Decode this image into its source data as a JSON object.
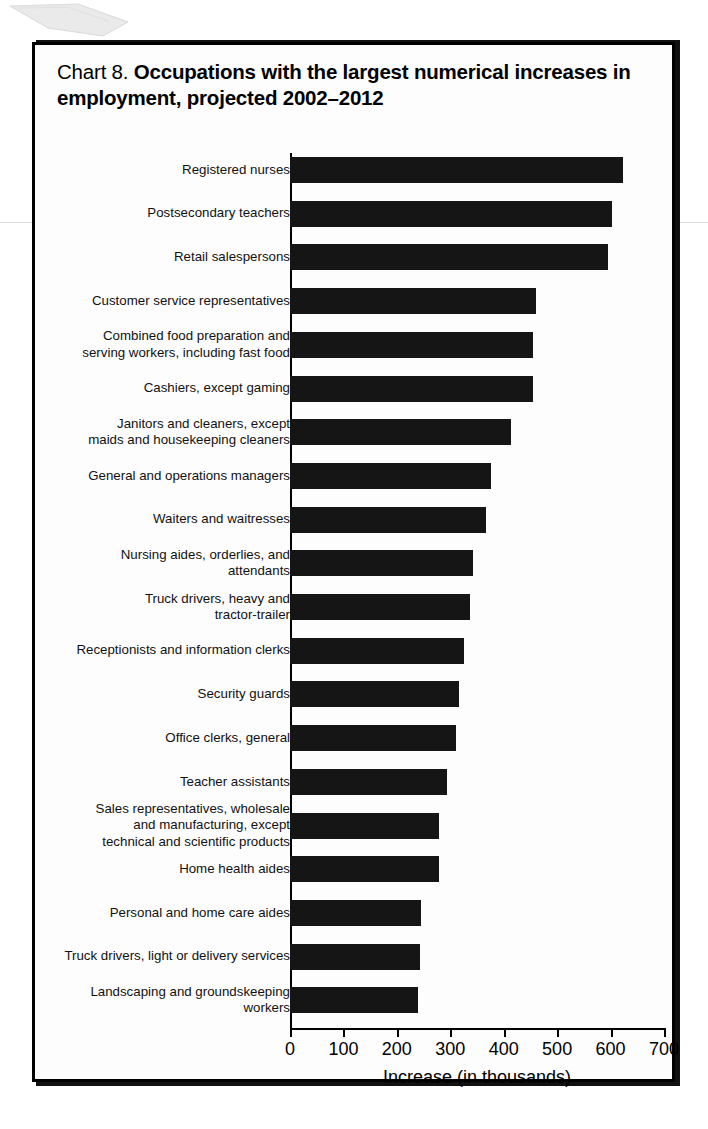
{
  "title": {
    "chart_number": "Chart 8.",
    "main": "Occupations with the largest numerical increases in employment, projected 2002–2012"
  },
  "chart_data": {
    "type": "bar",
    "orientation": "horizontal",
    "title": "Chart 8. Occupations with the largest numerical increases in employment, projected 2002–2012",
    "xlabel": "Increase (in thousands)",
    "ylabel": "",
    "xlim": [
      0,
      700
    ],
    "xticks": [
      "0",
      "100",
      "200",
      "300",
      "400",
      "500",
      "600",
      "700"
    ],
    "grid": false,
    "legend": null,
    "bar_color": "#151515",
    "categories": [
      "Registered nurses",
      "Postsecondary teachers",
      "Retail salespersons",
      "Customer service representatives",
      "Combined food preparation and serving workers, including fast food",
      "Cashiers, except gaming",
      "Janitors and cleaners, except maids and housekeeping cleaners",
      "General and operations managers",
      "Waiters and waitresses",
      "Nursing aides, orderlies, and attendants",
      "Truck drivers, heavy and tractor-trailer",
      "Receptionists and information clerks",
      "Security guards",
      "Office clerks, general",
      "Teacher assistants",
      "Sales representatives, wholesale and manufacturing, except technical and scientific products",
      "Home health aides",
      "Personal and home care aides",
      "Truck drivers, light or delivery services",
      "Landscaping and groundskeeping workers"
    ],
    "values": [
      623,
      603,
      596,
      460,
      454,
      454,
      414,
      376,
      367,
      343,
      337,
      325,
      317,
      310,
      294,
      279,
      279,
      246,
      244,
      240
    ]
  },
  "rows": [
    {
      "label_lines": [
        "Registered nurses"
      ],
      "value": 623
    },
    {
      "label_lines": [
        "Postsecondary teachers"
      ],
      "value": 603
    },
    {
      "label_lines": [
        "Retail salespersons"
      ],
      "value": 596
    },
    {
      "label_lines": [
        "Customer service representatives"
      ],
      "value": 460
    },
    {
      "label_lines": [
        "Combined food preparation and",
        "serving workers, including fast food"
      ],
      "value": 454
    },
    {
      "label_lines": [
        "Cashiers, except gaming"
      ],
      "value": 454
    },
    {
      "label_lines": [
        "Janitors and cleaners, except",
        "maids and housekeeping cleaners"
      ],
      "value": 414
    },
    {
      "label_lines": [
        "General and operations managers"
      ],
      "value": 376
    },
    {
      "label_lines": [
        "Waiters and waitresses"
      ],
      "value": 367
    },
    {
      "label_lines": [
        "Nursing aides, orderlies, and",
        "attendants"
      ],
      "value": 343
    },
    {
      "label_lines": [
        "Truck drivers, heavy and",
        "tractor-trailer"
      ],
      "value": 337
    },
    {
      "label_lines": [
        "Receptionists and information clerks"
      ],
      "value": 325
    },
    {
      "label_lines": [
        "Security guards"
      ],
      "value": 317
    },
    {
      "label_lines": [
        "Office clerks, general"
      ],
      "value": 310
    },
    {
      "label_lines": [
        "Teacher assistants"
      ],
      "value": 294
    },
    {
      "label_lines": [
        "Sales representatives, wholesale",
        "and manufacturing, except",
        "technical and scientific products"
      ],
      "value": 279
    },
    {
      "label_lines": [
        "Home health aides"
      ],
      "value": 279
    },
    {
      "label_lines": [
        "Personal and home care aides"
      ],
      "value": 246
    },
    {
      "label_lines": [
        "Truck drivers, light or delivery services"
      ],
      "value": 244
    },
    {
      "label_lines": [
        "Landscaping and groundskeeping",
        "workers"
      ],
      "value": 240
    }
  ],
  "xaxis": {
    "ticks": [
      "0",
      "100",
      "200",
      "300",
      "400",
      "500",
      "600",
      "700"
    ],
    "title": "Increase (in thousands)"
  }
}
